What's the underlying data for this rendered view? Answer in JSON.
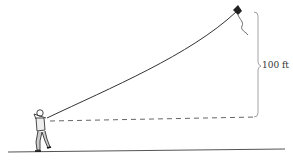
{
  "diagram": {
    "height_label": "100 ft",
    "colors": {
      "line": "#333333",
      "dashed": "#555555",
      "bracket": "#888888",
      "ground": "#444444",
      "text": "#333333"
    }
  }
}
